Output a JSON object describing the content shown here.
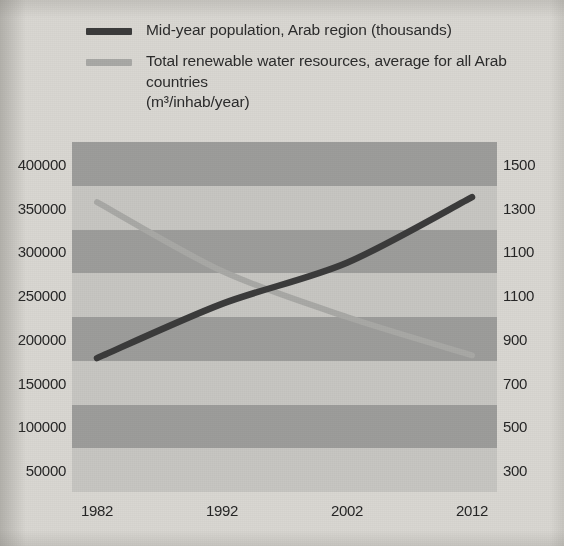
{
  "legend": {
    "series": [
      {
        "id": "population",
        "label": "Mid-year population, Arab region (thousands)",
        "label_line2": "",
        "color": "#3b3b3b"
      },
      {
        "id": "water",
        "label": "Total renewable water resources, average for all Arab countries",
        "label_line2": "(m³/inhab/year)",
        "color": "#a9a9a6"
      }
    ]
  },
  "colors": {
    "band_dark": "#9d9d9b",
    "band_light": "#c7c6c2",
    "page_background": "#d9d7d2",
    "text": "#262626",
    "population_line": "#3b3b3b",
    "water_line": "#a9a9a6"
  },
  "chart_data": {
    "type": "line",
    "title": "",
    "subtitle": "",
    "xlabel": "",
    "ylabel": "",
    "grid": "horizontal-bands",
    "legend_position": "top-left",
    "x": [
      1982,
      1992,
      2002,
      2012
    ],
    "xlim": [
      1980,
      2014
    ],
    "xticks": [
      "1982",
      "1992",
      "2002",
      "2012"
    ],
    "xtick_values": [
      1982,
      1992,
      2002,
      2012
    ],
    "axes": [
      {
        "id": "left",
        "side": "left",
        "label": "",
        "ylim": [
          50000,
          400000
        ],
        "ticks": [
          "400000",
          "350000",
          "300000",
          "250000",
          "200000",
          "150000",
          "100000",
          "50000"
        ],
        "tick_values": [
          400000,
          350000,
          300000,
          250000,
          200000,
          150000,
          100000,
          50000
        ]
      },
      {
        "id": "right",
        "side": "right",
        "label": "",
        "ylim": [
          300,
          1500
        ],
        "ticks": [
          "1500",
          "1300",
          "1100",
          "1100",
          "900",
          "700",
          "500",
          "300"
        ],
        "tick_values": [
          1500,
          1300,
          1100,
          1100,
          900,
          700,
          500,
          300
        ]
      }
    ],
    "series": [
      {
        "name": "Mid-year population, Arab region (thousands)",
        "axis": "left",
        "color": "#3b3b3b",
        "values": [
          178000,
          240000,
          287000,
          362000
        ]
      },
      {
        "name": "Total renewable water resources, average for all Arab countries (m³/inhab/year)",
        "axis": "right",
        "color": "#a9a9a6",
        "values": [
          1350,
          1080,
          900,
          750
        ]
      }
    ]
  }
}
